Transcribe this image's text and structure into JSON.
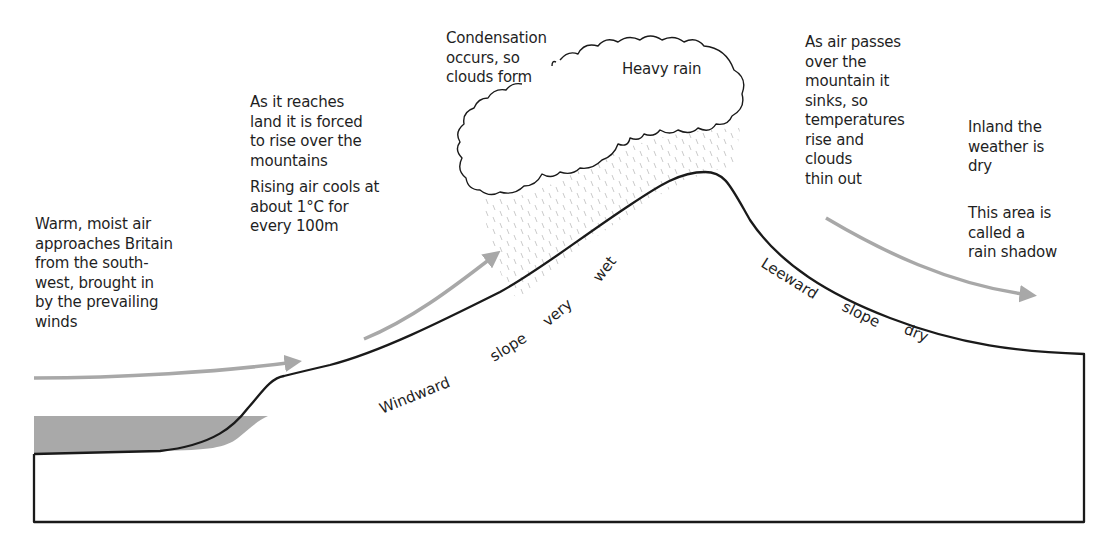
{
  "diagram": {
    "colors": {
      "outline": "#1a1a1a",
      "arrow": "#a8a8a8",
      "sea": "#a9a9a9",
      "rain": "#c4c4c4",
      "text": "#1f1f1f"
    },
    "labels": {
      "warm_air": "Warm, moist air\napproaches Britain\nfrom the south-\nwest, brought in\nby the prevailing\nwinds",
      "reaches_land": "As it reaches\nland it is forced\nto rise over the\nmountains",
      "rising_cools": "Rising air cools at\nabout 1°C for\nevery 100m",
      "condensation": "Condensation\noccurs, so\nclouds form",
      "heavy_rain": "Heavy rain",
      "air_passes": "As air passes\nover the\nmountain it\nsinks, so\ntemperatures\nrise and\nclouds\nthin out",
      "inland_dry": "Inland the\nweather is\ndry",
      "rain_shadow": "This area is\ncalled a\nrain shadow"
    },
    "windward_words": [
      "Windward",
      "slope",
      "very",
      "wet"
    ],
    "leeward_words": [
      "Leeward",
      "slope",
      "dry"
    ]
  }
}
